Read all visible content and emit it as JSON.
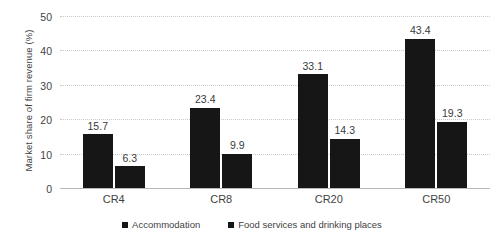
{
  "chart_data": {
    "type": "bar",
    "title": "",
    "xlabel": "",
    "ylabel": "Market share of firm revenue (%)",
    "categories": [
      "CR4",
      "CR8",
      "CR20",
      "CR50"
    ],
    "series": [
      {
        "name": "Accommodation",
        "values": [
          15.7,
          23.4,
          33.1,
          43.4
        ],
        "color": "#161616"
      },
      {
        "name": "Food services and drinking places",
        "values": [
          6.3,
          9.9,
          14.3,
          19.3
        ],
        "color": "#161616"
      }
    ],
    "ylim": [
      0,
      50
    ],
    "yticks": [
      0,
      10,
      20,
      30,
      40,
      50
    ],
    "ytick_labels": [
      "0",
      "10",
      "20",
      "30",
      "40",
      "50"
    ],
    "grid": true,
    "grid_color": "#c8c8c8",
    "legend_position": "bottom",
    "data_labels": [
      [
        "15.7",
        "6.3"
      ],
      [
        "23.4",
        "9.9"
      ],
      [
        "33.1",
        "14.3"
      ],
      [
        "43.4",
        "19.3"
      ]
    ]
  }
}
